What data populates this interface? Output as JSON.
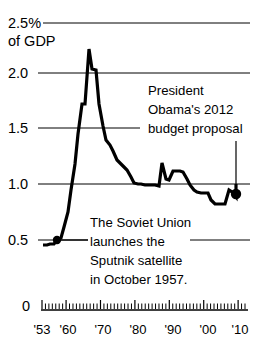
{
  "chart_data": {
    "type": "line",
    "title": "",
    "xlabel": "",
    "ylabel": "",
    "y_unit_label_line1": "2.5%",
    "y_unit_label_line2": "of GDP",
    "ylim": [
      0,
      2.5
    ],
    "xlim": [
      1953,
      2012
    ],
    "grid": true,
    "legend_position": "none",
    "y_ticks": [
      "2.5%",
      "2.0",
      "1.5",
      "1.0",
      "0.5",
      "0"
    ],
    "y_tick_values": [
      2.5,
      2.0,
      1.5,
      1.0,
      0.5,
      0
    ],
    "x_tick_labels": [
      "'53",
      "'60",
      "'70",
      "'80",
      "'90",
      "'00",
      "'10"
    ],
    "x_tick_values": [
      1953,
      1960,
      1970,
      1980,
      1990,
      2000,
      2010
    ],
    "series": [
      {
        "name": "NASA budget as share of GDP",
        "x": [
          1953,
          1954,
          1955,
          1956,
          1957,
          1958,
          1959,
          1960,
          1961,
          1962,
          1963,
          1964,
          1965,
          1966,
          1967,
          1968,
          1969,
          1970,
          1971,
          1972,
          1973,
          1974,
          1975,
          1976,
          1977,
          1978,
          1979,
          1980,
          1981,
          1982,
          1983,
          1984,
          1985,
          1986,
          1987,
          1988,
          1989,
          1990,
          1991,
          1992,
          1993,
          1994,
          1995,
          1996,
          1997,
          1998,
          1999,
          2000,
          2001,
          2002,
          2003,
          2004,
          2005,
          2006,
          2007,
          2008,
          2009,
          2010,
          2011,
          2012
        ],
        "values": [
          0.48,
          0.48,
          0.49,
          0.49,
          0.5,
          0.52,
          0.62,
          0.75,
          0.95,
          1.18,
          1.45,
          1.72,
          1.72,
          2.21,
          2.03,
          2.02,
          1.72,
          1.52,
          1.4,
          1.35,
          1.3,
          1.22,
          1.19,
          1.16,
          1.14,
          1.08,
          1.02,
          1.01,
          1.01,
          1.0,
          1.0,
          1.0,
          1.0,
          0.99,
          1.2,
          1.07,
          1.06,
          1.14,
          1.14,
          1.14,
          1.13,
          1.07,
          1.0,
          0.95,
          0.93,
          0.92,
          0.92,
          0.92,
          0.86,
          0.82,
          0.82,
          0.82,
          0.82,
          0.95,
          0.92,
          0.88,
          1.0,
          0.92,
          1.0,
          0.89
        ],
        "peak_value": 2.21,
        "peak_year": 1966,
        "end_value": 0.89,
        "end_year": 2012
      }
    ],
    "markers": [
      {
        "name": "sputnik-marker",
        "x": 1957,
        "y": 0.5
      },
      {
        "name": "obama-proposal-marker",
        "x": 2012,
        "y": 0.89
      }
    ],
    "annotations": [
      {
        "name": "obama-budget-annotation",
        "lines": [
          "President",
          "Obama's 2012",
          "budget proposal"
        ]
      },
      {
        "name": "sputnik-annotation",
        "lines": [
          "The Soviet Union",
          "launches the",
          "Sputnik satellite",
          "in October 1957."
        ]
      }
    ]
  },
  "colors": {
    "line": "#000000",
    "grid": "#000000",
    "background": "#ffffff",
    "text": "#000000"
  }
}
